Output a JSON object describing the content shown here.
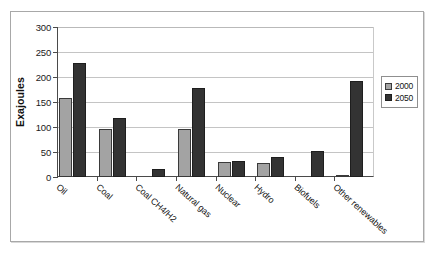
{
  "chart_data": {
    "type": "bar",
    "title": "",
    "subtitle": "",
    "xlabel": "",
    "ylabel": "Exajoules",
    "ylim": [
      0,
      300
    ],
    "ytick_step": 50,
    "ytick_labels": [
      "0",
      "50",
      "100",
      "150",
      "200",
      "250",
      "300"
    ],
    "grid": true,
    "legend_position": "right",
    "categories": [
      "Oil",
      "Coal",
      "Coal CH4/H2",
      "Natural gas",
      "Nuclear",
      "Hydro",
      "Biofuels",
      "Other renewables"
    ],
    "series": [
      {
        "name": "2000",
        "color": "#a3a3a3",
        "values": [
          159,
          97,
          0,
          96,
          30,
          29,
          0,
          4
        ]
      },
      {
        "name": "2050",
        "color": "#333333",
        "values": [
          228,
          118,
          17,
          178,
          33,
          40,
          52,
          192
        ]
      }
    ]
  },
  "legend": {
    "items": [
      {
        "label": "2000"
      },
      {
        "label": "2050"
      }
    ]
  },
  "colors": {
    "series_2000": "#a3a3a3",
    "series_2050": "#333333",
    "axis": "#4a4a4a",
    "gridline": "#c4c4c4",
    "frame": "#a8a8a8"
  }
}
